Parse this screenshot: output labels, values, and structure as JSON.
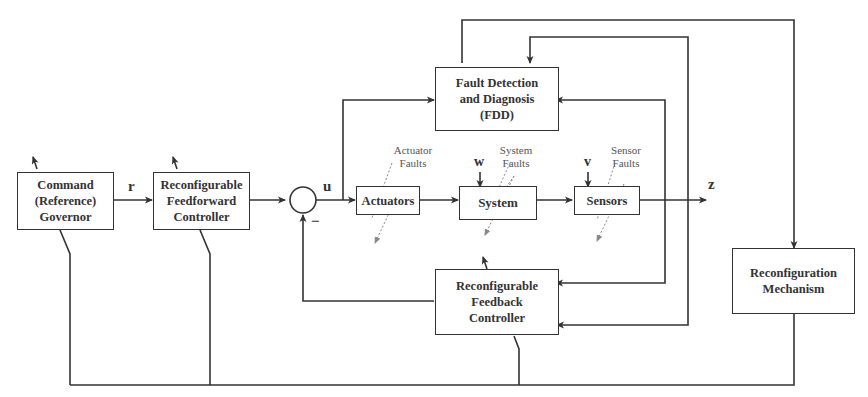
{
  "diagram": {
    "blocks": {
      "command_governor": {
        "line1": "Command",
        "line2": "(Reference)",
        "line3": "Governor"
      },
      "feedforward": {
        "line1": "Reconfigurable",
        "line2": "Feedforward",
        "line3": "Controller"
      },
      "actuators": {
        "label": "Actuators"
      },
      "system": {
        "label": "System"
      },
      "sensors": {
        "label": "Sensors"
      },
      "fdd": {
        "line1": "Fault Detection",
        "line2": "and Diagnosis",
        "line3": "(FDD)"
      },
      "feedback": {
        "line1": "Reconfigurable",
        "line2": "Feedback",
        "line3": "Controller"
      },
      "reconfiguration": {
        "line1": "Reconfiguration",
        "line2": "Mechanism"
      }
    },
    "signals": {
      "r": "r",
      "u": "u",
      "w": "w",
      "v": "v",
      "z": "z",
      "minus": "−"
    },
    "faults": {
      "actuator": {
        "line1": "Actuator",
        "line2": "Faults"
      },
      "system": {
        "line1": "System",
        "line2": "Faults"
      },
      "sensor": {
        "line1": "Sensor",
        "line2": "Faults"
      }
    },
    "colors": {
      "line": "#333333",
      "fault_arrow": "#888888"
    }
  }
}
